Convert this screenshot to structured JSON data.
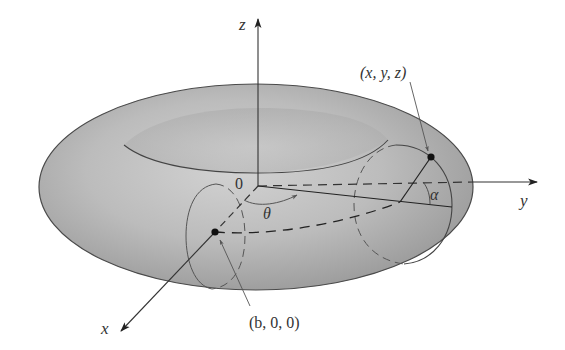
{
  "figure": {
    "axes": {
      "x_label": "x",
      "y_label": "y",
      "z_label": "z",
      "origin_label": "0"
    },
    "angles": {
      "theta_label": "θ",
      "alpha_label": "α"
    },
    "points": {
      "center_point_label": "(b, 0, 0)",
      "surface_point_label": "(x, y, z)"
    },
    "colors": {
      "torus_fill": "#b4b4b4",
      "torus_highlight": "#cfcfcf",
      "stroke": "#3a3a3a",
      "axis": "#333333",
      "background": "#ffffff"
    }
  }
}
